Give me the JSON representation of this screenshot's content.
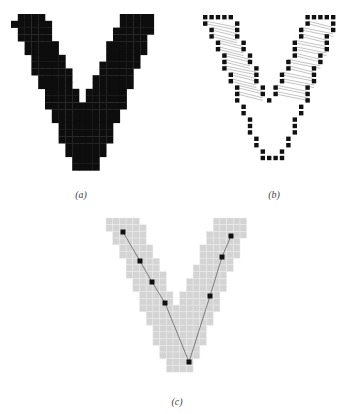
{
  "figure": {
    "panels": [
      {
        "id": "a",
        "caption": "(a)",
        "description": "Binary pixelated V-shaped object, filled solid",
        "fill_color": "#0d0d0d",
        "style": "solid"
      },
      {
        "id": "b",
        "caption": "(b)",
        "description": "Boundary pixels of the V shape with thin chord lines connecting opposite contour points along each arm",
        "pixel_color": "#111111",
        "chord_color": "#888888",
        "style": "outline-with-chords"
      },
      {
        "id": "c",
        "caption": "(c)",
        "description": "V shape in light gray pixel grid with skeleton polyline and key points",
        "fill_color": "#d4d4d4",
        "grid_color": "#ebebeb",
        "skeleton_color": "#555555",
        "keypoint_color": "#111111",
        "keypoint_count": 8,
        "style": "skeleton"
      }
    ]
  }
}
